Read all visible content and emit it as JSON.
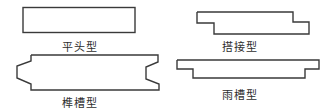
{
  "diagram": {
    "title": "",
    "items": [
      {
        "id": "flat",
        "label": "平头型",
        "shape": "flat-rectangle"
      },
      {
        "id": "lap",
        "label": "搭接型",
        "shape": "lap-joint-step"
      },
      {
        "id": "tongue",
        "label": "榫槽型",
        "shape": "tongue-and-groove"
      },
      {
        "id": "rain",
        "label": "雨槽型",
        "shape": "rain-groove-step"
      }
    ],
    "colors": {
      "stroke": "#3a3a3a",
      "text": "#2e2e2e",
      "background": "#ffffff"
    }
  }
}
